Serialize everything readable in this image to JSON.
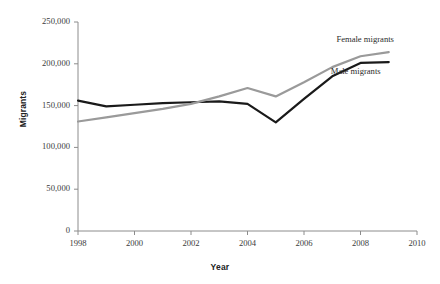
{
  "chart_data": {
    "type": "line",
    "title": "",
    "xlabel": "Year",
    "ylabel": "Migrants",
    "xlim": [
      1998,
      2010
    ],
    "ylim": [
      0,
      250000
    ],
    "grid": false,
    "legend_position": "inline-right",
    "x": [
      1998,
      1999,
      2000,
      2001,
      2002,
      2003,
      2004,
      2005,
      2006,
      2007,
      2008,
      2009
    ],
    "xticks": [
      1998,
      2000,
      2002,
      2004,
      2006,
      2008,
      2010
    ],
    "xtick_labels": [
      "1998",
      "2000",
      "2002",
      "2004",
      "2006",
      "2008",
      "2010"
    ],
    "yticks": [
      0,
      50000,
      100000,
      150000,
      200000,
      250000
    ],
    "ytick_labels": [
      "0",
      "50,000",
      "100,000",
      "150,000",
      "200,000",
      "250,000"
    ],
    "series": [
      {
        "name": "Male migrants",
        "color": "#1a1a1a",
        "width": 2.2,
        "values": [
          156000,
          149000,
          151000,
          153000,
          154000,
          155000,
          152000,
          130000,
          158000,
          185000,
          201000,
          202000
        ]
      },
      {
        "name": "Female migrants",
        "color": "#9a9a9a",
        "width": 2.2,
        "values": [
          131000,
          136000,
          141000,
          146000,
          152000,
          161000,
          171000,
          161000,
          178000,
          196000,
          209000,
          214000
        ]
      }
    ],
    "annotations": [
      {
        "text": "Female migrants",
        "x": 2009.2,
        "y": 228000
      },
      {
        "text": "Male migrants",
        "x": 2009.0,
        "y": 190000
      }
    ]
  },
  "axes": {
    "axis_color": "#8c8c8c",
    "tick_color": "#8c8c8c"
  }
}
